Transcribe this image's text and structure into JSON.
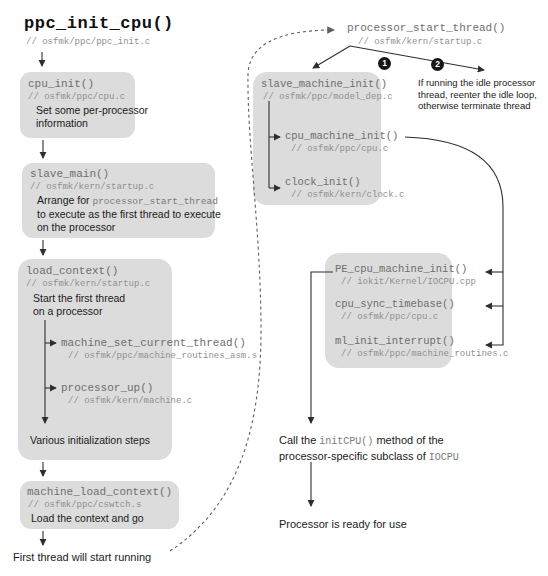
{
  "title": {
    "name": "ppc_init_cpu()",
    "comment": "// osfmk/ppc/ppc_init.c"
  },
  "left": {
    "cpu_init": {
      "name": "cpu_init()",
      "comment": "// osfmk/ppc/cpu.c",
      "desc": "Set some per-processor\ninformation"
    },
    "slave_main": {
      "name": "slave_main()",
      "comment": "// osfmk/kern/startup.c",
      "desc_prefix": "Arrange for ",
      "desc_code": "processor_start_thread",
      "desc_rest": "\nto execute as the first thread to execute\non the processor"
    },
    "load_context": {
      "name": "load_context()",
      "comment": "// osfmk/kern/startup.c",
      "desc": "Start the first thread\non a processor",
      "children": [
        {
          "name": "machine_set_current_thread()",
          "comment": "// osfmk/ppc/machine_routines_asm.s"
        },
        {
          "name": "processor_up()",
          "comment": "// osfmk/kern/machine.c"
        }
      ],
      "footer": "Various initialization steps"
    },
    "machine_load_context": {
      "name": "machine_load_context()",
      "comment": "// osfmk/ppc/cswtch.s",
      "desc": "Load the context and go"
    },
    "outcome": "First thread will start running"
  },
  "right": {
    "pst": {
      "name": "processor_start_thread()",
      "comment": "// osfmk/kern/startup.c"
    },
    "badges": [
      "1",
      "2"
    ],
    "idle_note": "If running the idle processor\nthread, reenter the idle loop,\notherwise terminate thread",
    "smi": {
      "name": "slave_machine_init()",
      "comment": "// osfmk/ppc/model_dep.c",
      "children": [
        {
          "name": "cpu_machine_init()",
          "comment": "// osfmk/ppc/cpu.c"
        },
        {
          "name": "clock_init()",
          "comment": "// osfmk/kern/clock.c"
        }
      ]
    },
    "iocpu": {
      "items": [
        {
          "name": "PE_cpu_machine_init()",
          "comment": "// iokit/Kernel/IOCPU.cpp"
        },
        {
          "name": "cpu_sync_timebase()",
          "comment": "// osfmk/ppc/cpu.c"
        },
        {
          "name": "ml_init_interrupt()",
          "comment": "// osfmk/ppc/machine_routines.c"
        }
      ]
    },
    "call_note": {
      "p1": "Call the ",
      "c1": "initCPU()",
      "p2": " method of the\nprocessor-specific subclass of ",
      "c2": "IOCPU"
    },
    "outcome": "Processor is ready for use"
  }
}
